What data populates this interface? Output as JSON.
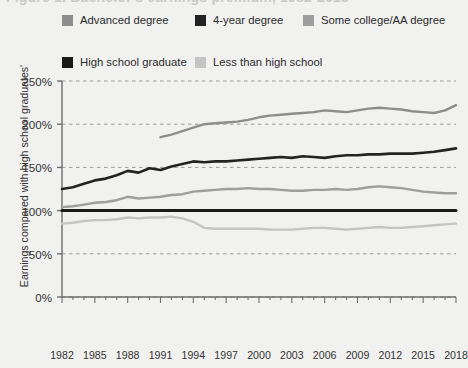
{
  "title": {
    "text": "Figure 1. Bachelor's earnings premium, 1982-2018",
    "note": "clipped at top edge of screenshot"
  },
  "legend": {
    "rows": [
      [
        {
          "label": "Advanced degree",
          "color": "#8d8d8d",
          "key": "advanced"
        },
        {
          "label": "4-year degree",
          "color": "#232323",
          "key": "fouryear"
        },
        {
          "label": "Some college/AA degree",
          "color": "#9e9e9e",
          "key": "somecollege"
        }
      ],
      [
        {
          "label": "High school graduate",
          "color": "#1a1a1a",
          "key": "hsgrad"
        },
        {
          "label": "Less than high school",
          "color": "#c4c4c4",
          "key": "lessthanhs"
        }
      ]
    ]
  },
  "chart_data": {
    "type": "line",
    "title": "Figure 1. Bachelor's earnings premium, 1982-2018",
    "xlabel": "",
    "ylabel": "Earnings compared with high school graduates'",
    "xlim": [
      1982,
      2018
    ],
    "ylim": [
      0,
      250
    ],
    "yticks": [
      0,
      50,
      100,
      150,
      200,
      250
    ],
    "ytick_labels": [
      "0%",
      "50%",
      "100%",
      "150%",
      "200%",
      "250%"
    ],
    "xticks": [
      1982,
      1985,
      1988,
      1991,
      1994,
      1997,
      2000,
      2003,
      2006,
      2009,
      2012,
      2015,
      2018
    ],
    "xtick_labels": [
      "1982",
      "1985",
      "1988",
      "1991",
      "1994",
      "1997",
      "2000",
      "2003",
      "2006",
      "2009",
      "2012",
      "2015",
      "2018"
    ],
    "grid": "horizontal-dashed",
    "legend_position": "above-plot",
    "x": [
      1982,
      1983,
      1984,
      1985,
      1986,
      1987,
      1988,
      1989,
      1990,
      1991,
      1992,
      1993,
      1994,
      1995,
      1996,
      1997,
      1998,
      1999,
      2000,
      2001,
      2002,
      2003,
      2004,
      2005,
      2006,
      2007,
      2008,
      2009,
      2010,
      2011,
      2012,
      2013,
      2014,
      2015,
      2016,
      2017,
      2018
    ],
    "series": [
      {
        "name": "Advanced degree",
        "color": "#8d8d8d",
        "values": [
          null,
          null,
          null,
          null,
          null,
          null,
          null,
          null,
          null,
          185,
          188,
          192,
          196,
          200,
          201,
          202,
          203,
          205,
          208,
          210,
          211,
          212,
          213,
          214,
          216,
          215,
          214,
          216,
          218,
          219,
          218,
          217,
          215,
          214,
          213,
          216,
          222
        ]
      },
      {
        "name": "4-year degree",
        "color": "#232323",
        "values": [
          125,
          127,
          131,
          135,
          137,
          141,
          146,
          144,
          149,
          147,
          151,
          154,
          157,
          156,
          157,
          157,
          158,
          159,
          160,
          161,
          162,
          161,
          163,
          162,
          161,
          163,
          164,
          164,
          165,
          165,
          166,
          166,
          166,
          167,
          168,
          170,
          172
        ]
      },
      {
        "name": "Some college/AA degree",
        "color": "#9e9e9e",
        "values": [
          104,
          105,
          107,
          109,
          110,
          112,
          116,
          114,
          115,
          116,
          118,
          119,
          122,
          123,
          124,
          125,
          125,
          126,
          125,
          125,
          124,
          123,
          123,
          124,
          124,
          125,
          124,
          125,
          127,
          128,
          127,
          126,
          124,
          122,
          121,
          120,
          120
        ]
      },
      {
        "name": "High school graduate",
        "color": "#1a1a1a",
        "values": [
          100,
          100,
          100,
          100,
          100,
          100,
          100,
          100,
          100,
          100,
          100,
          100,
          100,
          100,
          100,
          100,
          100,
          100,
          100,
          100,
          100,
          100,
          100,
          100,
          100,
          100,
          100,
          100,
          100,
          100,
          100,
          100,
          100,
          100,
          100,
          100,
          100
        ]
      },
      {
        "name": "Less than high school",
        "color": "#c4c4c4",
        "values": [
          85,
          86,
          88,
          89,
          89,
          90,
          92,
          91,
          92,
          92,
          93,
          91,
          87,
          80,
          79,
          79,
          79,
          79,
          79,
          78,
          78,
          78,
          79,
          80,
          80,
          79,
          78,
          79,
          80,
          81,
          80,
          80,
          81,
          82,
          83,
          84,
          85
        ]
      }
    ]
  }
}
